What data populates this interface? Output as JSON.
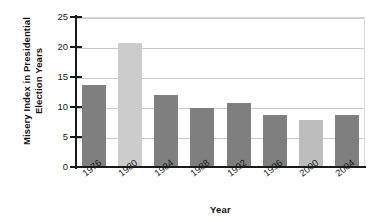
{
  "chart_data": {
    "type": "bar",
    "title": "",
    "xlabel": "Year",
    "ylabel": "Misery Index in Presidential Election Years",
    "ylabel_line1": "Misery Index in Presidential",
    "ylabel_line2": "Election Years",
    "categories": [
      "1976",
      "1980",
      "1984",
      "1988",
      "1992",
      "1996",
      "2000",
      "2004"
    ],
    "values": [
      13.6,
      20.7,
      12.0,
      9.8,
      10.7,
      8.7,
      7.8,
      8.7
    ],
    "bar_colors": [
      "#7f7f7f",
      "#cccccc",
      "#7f7f7f",
      "#7f7f7f",
      "#7f7f7f",
      "#7f7f7f",
      "#bdbdbd",
      "#7f7f7f"
    ],
    "ylim": [
      0,
      25
    ],
    "ytick_values": [
      0,
      5,
      10,
      15,
      20,
      25
    ],
    "ytick_labels": [
      "0",
      "5",
      "10",
      "15",
      "20",
      "25"
    ],
    "grid": "horizontal",
    "legend": "none",
    "axis_color": "#1a1a1a",
    "gridline_color": "#c9c9c9"
  }
}
